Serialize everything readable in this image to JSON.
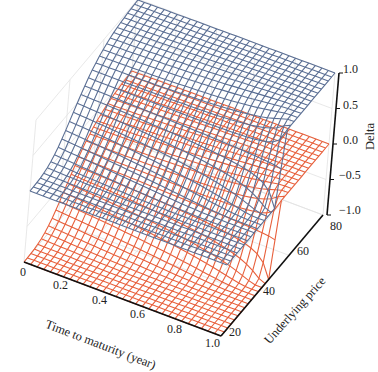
{
  "chart_data": {
    "type": "surface3d",
    "title": "",
    "xlabel": "Time to maturity (year)",
    "ylabel": "Underlying price",
    "zlabel": "Delta",
    "x_ticks": [
      "0",
      "0.2",
      "0.4",
      "0.6",
      "0.8",
      "1.0"
    ],
    "y_ticks": [
      "20",
      "40",
      "60",
      "80"
    ],
    "z_ticks": [
      "−1.0",
      "−0.5",
      "0.0",
      "0.5",
      "1.0"
    ],
    "xlim": [
      0,
      1.0
    ],
    "ylim": [
      20,
      80
    ],
    "zlim": [
      -1.0,
      1.0
    ],
    "grid": true,
    "series": [
      {
        "name": "Call delta",
        "color": "#5b6f94",
        "range": [
          0,
          1
        ],
        "strike": 50,
        "vol": 0.25,
        "rate": 0.05
      },
      {
        "name": "Put delta",
        "color": "#e8603c",
        "range": [
          -1,
          0
        ],
        "strike": 50,
        "vol": 0.25,
        "rate": 0.05
      }
    ],
    "grid_resolution": {
      "t_steps": 30,
      "s_steps": 30
    }
  }
}
